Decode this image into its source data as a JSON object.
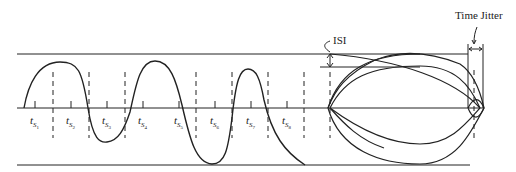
{
  "diagram": {
    "title": "",
    "labels": {
      "isi": "ISI",
      "time_jitter": "Time Jitter"
    },
    "sample_labels": [
      {
        "t": "t",
        "s": "S",
        "n": "1"
      },
      {
        "t": "t",
        "s": "S",
        "n": "2"
      },
      {
        "t": "t",
        "s": "S",
        "n": "3"
      },
      {
        "t": "t",
        "s": "S",
        "n": "4"
      },
      {
        "t": "t",
        "s": "S",
        "n": "5"
      },
      {
        "t": "t",
        "s": "S",
        "n": "6"
      },
      {
        "t": "t",
        "s": "S",
        "n": "7"
      },
      {
        "t": "t",
        "s": "S",
        "n": "8"
      }
    ],
    "colors": {
      "line": "#222222",
      "background": "#ffffff"
    }
  }
}
